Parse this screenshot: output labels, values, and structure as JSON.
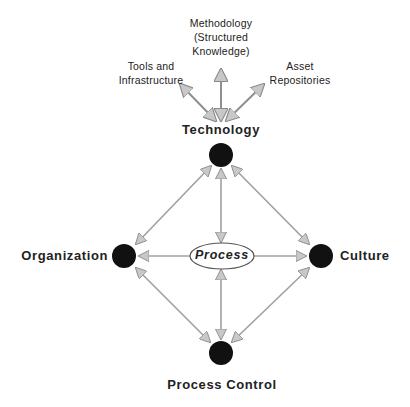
{
  "diagram": {
    "top_labels": {
      "methodology_line1": "Methodology",
      "methodology_line2": "(Structured",
      "methodology_line3": "Knowledge)",
      "tools_line1": "Tools and",
      "tools_line2": "Infrastructure",
      "asset_line1": "Asset",
      "asset_line2": "Repositories"
    },
    "nodes": {
      "technology": "Technology",
      "organization": "Organization",
      "culture": "Culture",
      "process_control": "Process Control",
      "process": "Process"
    },
    "colors": {
      "node_fill": "#111111",
      "arrow": "#9a9a9a",
      "arrowhead": "#c4c4c4",
      "text": "#222222"
    }
  }
}
